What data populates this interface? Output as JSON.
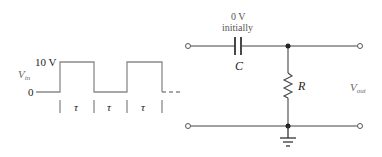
{
  "waveform": {
    "high_label": "10 V",
    "low_label": "0",
    "input_label": "V",
    "input_sub": "in",
    "period_labels": [
      "τ",
      "τ",
      "τ"
    ]
  },
  "circuit": {
    "cap_initial_voltage": "0 V",
    "cap_initial_note": "initially",
    "capacitor_label": "C",
    "resistor_label": "R",
    "output_label": "V",
    "output_sub": "out"
  },
  "colors": {
    "wire": "#444444",
    "waveform": "#888888",
    "terminal": "#555555"
  }
}
